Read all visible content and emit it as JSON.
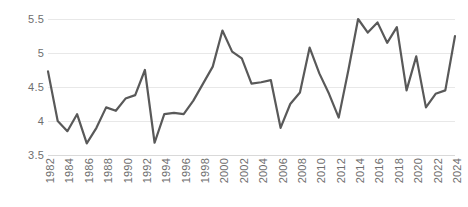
{
  "chart_data": {
    "type": "line",
    "title": "",
    "subtitle": "",
    "xlabel": "",
    "ylabel": "",
    "legend": [],
    "legend_position": "none",
    "grid": true,
    "xlim": [
      1982,
      2024
    ],
    "ylim": [
      3.5,
      5.5
    ],
    "yticks": [
      3.5,
      4,
      4.5,
      5,
      5.5
    ],
    "ytick_labels": [
      "3.5",
      "4",
      "4.5",
      "5",
      "5.5"
    ],
    "xticks": [
      1982,
      1984,
      1986,
      1988,
      1990,
      1992,
      1994,
      1996,
      1998,
      2000,
      2002,
      2004,
      2006,
      2008,
      2010,
      2012,
      2014,
      2016,
      2018,
      2020,
      2022,
      2024
    ],
    "xtick_labels": [
      "1982",
      "1984",
      "1986",
      "1988",
      "1990",
      "1992",
      "1994",
      "1996",
      "1998",
      "2000",
      "2002",
      "2004",
      "2006",
      "2008",
      "2010",
      "2012",
      "2014",
      "2016",
      "2018",
      "2020",
      "2022",
      "2024"
    ],
    "xtick_rotation": 90,
    "line_color": "#595959",
    "grid_color": "#e8e8e8",
    "axis_color": "#d9d9d9",
    "tick_label_color": "#6e6e6e",
    "x": [
      1982,
      1983,
      1984,
      1985,
      1986,
      1987,
      1988,
      1989,
      1990,
      1991,
      1992,
      1993,
      1994,
      1995,
      1996,
      1997,
      1998,
      1999,
      2000,
      2001,
      2002,
      2003,
      2004,
      2005,
      2006,
      2007,
      2008,
      2009,
      2010,
      2011,
      2012,
      2013,
      2014,
      2015,
      2016,
      2017,
      2018,
      2019,
      2020,
      2021,
      2022,
      2023,
      2024
    ],
    "values": [
      4.73,
      4.0,
      3.85,
      4.1,
      3.67,
      3.9,
      4.2,
      4.15,
      4.33,
      4.38,
      4.75,
      3.68,
      4.1,
      4.12,
      4.1,
      4.3,
      4.55,
      4.8,
      5.33,
      5.02,
      4.92,
      4.55,
      4.57,
      4.6,
      3.9,
      4.25,
      4.42,
      5.08,
      4.7,
      4.4,
      4.05,
      4.75,
      5.5,
      5.3,
      5.45,
      5.15,
      5.38,
      4.45,
      4.95,
      4.2,
      4.4,
      4.45,
      5.25
    ],
    "series_name": "series-1"
  }
}
